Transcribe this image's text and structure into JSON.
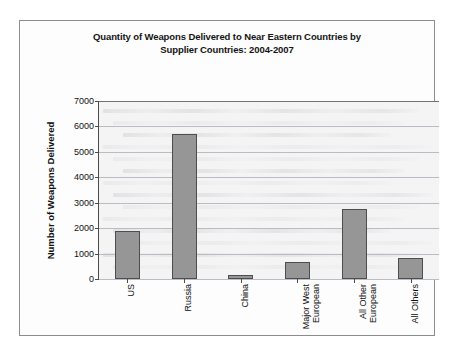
{
  "figure": {
    "title_line1": "Quantity of Weapons Delivered to Near Eastern Countries by",
    "title_line2": "Supplier Countries: 2004-2007",
    "bar_color": "#969696",
    "bar_border_color": "#4d4d4d",
    "plot_background": "#f4f4f4",
    "gridline_color": "#b9bcc4",
    "axis_color": "#4a4a4a",
    "frame_border_color": "#8c8c8c"
  },
  "chart_data": {
    "type": "bar",
    "title": "Quantity of Weapons Delivered to Near Eastern Countries by Supplier Countries: 2004-2007",
    "xlabel": "",
    "ylabel": "Number of Weapons Delivered",
    "categories": [
      "US",
      "Russia",
      "China",
      "Major West European",
      "All Other European",
      "All Others"
    ],
    "category_lines": [
      [
        "US"
      ],
      [
        "Russia"
      ],
      [
        "China"
      ],
      [
        "Major West",
        "European"
      ],
      [
        "All Other",
        "European"
      ],
      [
        "All Others"
      ]
    ],
    "values": [
      1900,
      5700,
      150,
      680,
      2770,
      830
    ],
    "ylim": [
      0,
      7000
    ],
    "yticks": [
      0,
      1000,
      2000,
      3000,
      4000,
      5000,
      6000,
      7000
    ],
    "ytick_labels": [
      "0",
      "1000",
      "2000",
      "3000",
      "4000",
      "5000",
      "6000",
      "7000"
    ],
    "grid": true,
    "legend": false
  }
}
